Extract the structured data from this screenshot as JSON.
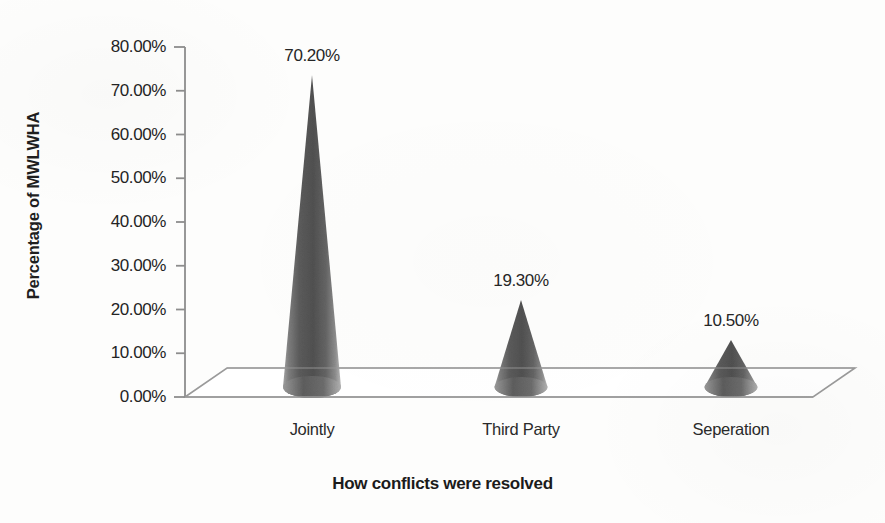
{
  "chart_data": {
    "type": "bar",
    "subtype": "3d-cone",
    "title": "",
    "categories": [
      "Jointly",
      "Third Party",
      "Seperation"
    ],
    "values": [
      70.2,
      19.3,
      10.5
    ],
    "data_labels": [
      "70.20%",
      "19.30%",
      "10.50%"
    ],
    "xlabel": "How conflicts were resolved",
    "ylabel": "Percentage of MWLWHA",
    "ylim": [
      0,
      80
    ],
    "ytick_step": 10,
    "ytick_labels": [
      "80.00%",
      "70.00%",
      "60.00%",
      "50.00%",
      "40.00%",
      "30.00%",
      "20.00%",
      "10.00%",
      "0.00%"
    ],
    "ytick_values": [
      80,
      70,
      60,
      50,
      40,
      30,
      20,
      10,
      0
    ],
    "grid": false,
    "legend": false,
    "legend_position": "none",
    "units": "percent",
    "series": [
      {
        "name": "Percentage of MWLWHA",
        "values": [
          70.2,
          19.3,
          10.5
        ]
      }
    ]
  },
  "colors": {
    "background": "#fdfdfc",
    "axis_line": "#8d8d8d",
    "floor_line": "#9a9a9a",
    "cone_dark": "#4f4f4f",
    "cone_mid": "#6e6e6e",
    "cone_light": "#9d9d9d",
    "text": "#242424",
    "title_text": "#1b1b1b"
  },
  "geometry": {
    "plot_left": 185,
    "plot_baseline_y": 397,
    "plot_top_y": 47,
    "depth_dx": 42,
    "depth_dy": -29,
    "floor_right_x": 813,
    "px_per_ten_percent": 43.75,
    "cone_centers_x": [
      312,
      521,
      731
    ],
    "cone_base_half_width": [
      29,
      26.5,
      26.5
    ],
    "cone_base_y": [
      390,
      390,
      390
    ],
    "cone_apex_y": [
      75,
      300,
      340
    ]
  }
}
